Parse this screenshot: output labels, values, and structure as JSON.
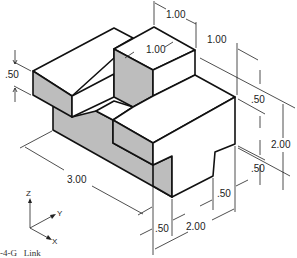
{
  "figure": {
    "caption": "-4-G   Link",
    "type": "isometric engineering drawing",
    "object_name": "Link"
  },
  "dimensions": {
    "top_left_height": ".50",
    "top_tower_width": "1.00",
    "top_tower_depth": "1.00",
    "top_right_offset": "1.00",
    "right_upper": ".50",
    "right_total_height": "2.00",
    "right_lower": ".50",
    "bottom_step": ".50",
    "bottom_width": "2.00",
    "bottom_left": ".50",
    "length": "3.00"
  },
  "axes": {
    "z": "Z",
    "y": "Y",
    "x": "X"
  },
  "colors": {
    "shade": "#bdbdbd",
    "line": "#111111",
    "background": "#ffffff"
  }
}
